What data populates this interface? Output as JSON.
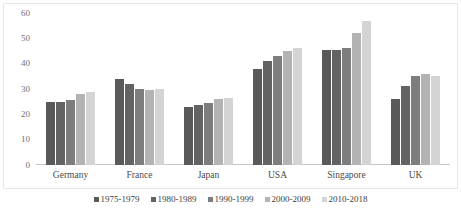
{
  "chart_data": {
    "type": "bar",
    "title": "",
    "subtitle": "",
    "xlabel": "",
    "ylabel": "",
    "ylim": [
      0,
      60
    ],
    "yticks": [
      0,
      10,
      20,
      30,
      40,
      50,
      60
    ],
    "grid": false,
    "legend_position": "bottom",
    "categories": [
      "Germany",
      "France",
      "Japan",
      "USA",
      "Singapore",
      "UK"
    ],
    "series": [
      {
        "name": "1975-1979",
        "color": "#595959",
        "values": [
          25,
          34,
          23,
          38,
          45.5,
          26
        ]
      },
      {
        "name": "1980-1989",
        "color": "#636363",
        "values": [
          25,
          32,
          23.5,
          41,
          45.5,
          31
        ]
      },
      {
        "name": "1990-1999",
        "color": "#7d7d7d",
        "values": [
          25.5,
          30,
          24.5,
          43,
          46,
          35
        ]
      },
      {
        "name": "2000-2009",
        "color": "#b3b3b3",
        "values": [
          28,
          29.5,
          26,
          45,
          52,
          36
        ]
      },
      {
        "name": "2010-2018",
        "color": "#d4d4d4",
        "values": [
          29,
          30,
          26.5,
          46,
          57,
          35
        ]
      }
    ]
  },
  "axis": {
    "y_tick_labels": [
      "0",
      "10",
      "20",
      "30",
      "40",
      "50",
      "60"
    ]
  }
}
